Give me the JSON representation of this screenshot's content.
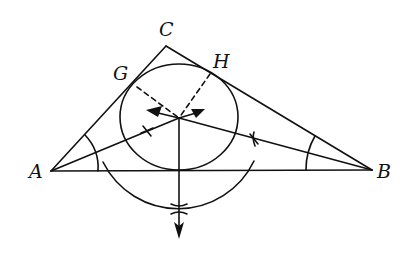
{
  "figure": {
    "labels": {
      "A": "A",
      "B": "B",
      "C": "C",
      "G": "G",
      "H": "H"
    },
    "line_color": "#111111",
    "background": "#ffffff",
    "vertices": {
      "A": [
        51,
        171
      ],
      "B": [
        372,
        170
      ],
      "C": [
        166,
        46
      ]
    },
    "incenter": [
      179,
      118
    ],
    "incircle": {
      "cx": 179,
      "cy": 117,
      "rx": 59,
      "ry": 53
    },
    "tangent_points": {
      "G": [
        136,
        80
      ],
      "H": [
        210,
        71
      ]
    }
  }
}
